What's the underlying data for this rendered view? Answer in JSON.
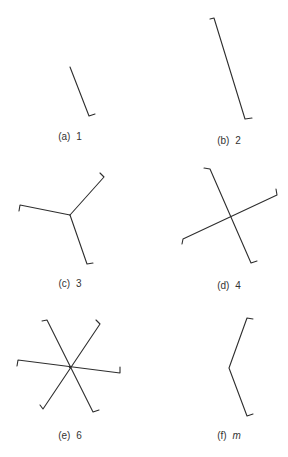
{
  "figure": {
    "line_color": "#2e2e2e",
    "panels": [
      {
        "id": "a",
        "letter": "(a)",
        "fold": "1",
        "fold_italic": false,
        "arms": 1
      },
      {
        "id": "b",
        "letter": "(b)",
        "fold": "2",
        "fold_italic": false,
        "arms": 2
      },
      {
        "id": "c",
        "letter": "(c)",
        "fold": "3",
        "fold_italic": false,
        "arms": 3
      },
      {
        "id": "d",
        "letter": "(d)",
        "fold": "4",
        "fold_italic": false,
        "arms": 4
      },
      {
        "id": "e",
        "letter": "(e)",
        "fold": "6",
        "fold_italic": false,
        "arms": 6
      },
      {
        "id": "f",
        "letter": "(f)",
        "fold": "m",
        "fold_italic": true,
        "arms": 2
      }
    ]
  }
}
